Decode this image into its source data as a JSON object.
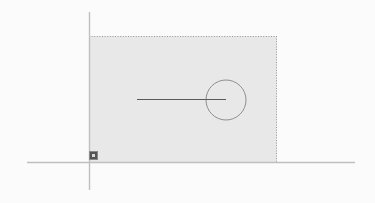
{
  "canvas": {
    "width": 375,
    "height": 203,
    "background_color": "#fbfbfb",
    "label": "Geometry canvas"
  },
  "axes": {
    "x_axis": {
      "label": "x-axis",
      "color": "#bfbfbf",
      "x1": 27,
      "y1": 162,
      "x2": 355,
      "y2": 162,
      "stroke_width": 1.4
    },
    "y_axis": {
      "label": "y-axis",
      "color": "#bfbfbf",
      "x1": 89,
      "y1": 12,
      "x2": 89,
      "y2": 190,
      "stroke_width": 1.4
    },
    "origin": {
      "label": "origin",
      "x": 89,
      "y": 162
    }
  },
  "shapes": {
    "rectangle": {
      "label": "Shaded rectangle",
      "x": 89,
      "y": 36,
      "width": 188,
      "height": 126,
      "fill_color": "#e8e8e8",
      "border_color": "#9a9a9a",
      "border_style": "dotted",
      "border_edges": "top,right",
      "selected": true
    },
    "circle": {
      "label": "Circle",
      "cx": 226,
      "cy": 100,
      "r": 20,
      "stroke_color": "#8f8f8f",
      "stroke_width": 1,
      "fill": "none"
    },
    "radius_line": {
      "label": "Radius line",
      "x1": 137,
      "y1": 99,
      "x2": 226,
      "y2": 99,
      "stroke_color": "#5a5a5a",
      "stroke_width": 1.2
    }
  },
  "handles": {
    "bottom_left": {
      "label": "Bottom-left resize handle",
      "x": 89,
      "y": 151,
      "size": 9,
      "color": "#555555"
    }
  }
}
